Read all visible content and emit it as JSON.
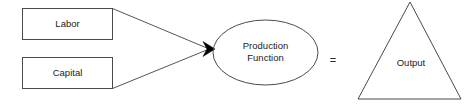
{
  "diagram": {
    "background_color": "#ffffff",
    "shape_stroke_color": "#4a4a4a",
    "line_color": "#555555",
    "arrow_color": "#000000",
    "text_color": "#1a1a1a",
    "nodes": {
      "labor": {
        "label": "Labor",
        "shape": "rectangle"
      },
      "capital": {
        "label": "Capital",
        "shape": "rectangle"
      },
      "production_function": {
        "label_line1": "Production",
        "label_line2": "Function",
        "shape": "ellipse"
      },
      "output": {
        "label": "Output",
        "shape": "triangle"
      }
    },
    "operators": {
      "equals": "="
    },
    "icons": {
      "arrowhead": "arrowhead-icon"
    }
  }
}
